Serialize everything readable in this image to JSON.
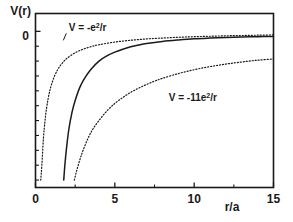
{
  "chart_data": {
    "type": "line",
    "title": "",
    "xlabel": "r/a",
    "ylabel": "V(r)",
    "xlim": [
      0,
      15
    ],
    "ylim": [
      -1.05,
      0.12
    ],
    "grid": false,
    "legend": "none",
    "x_ticks_major": [
      0,
      5,
      10,
      15
    ],
    "x_ticklabels": [
      "0",
      "5",
      "10",
      "15"
    ],
    "x_ticks_minor": [
      2.5,
      7.5,
      12.5
    ],
    "y_ticks_major": [
      0
    ],
    "y_ticklabels": [
      "0"
    ],
    "y_ticks_minor": [
      -0.1,
      -0.2,
      -0.3,
      -0.4,
      -0.5,
      -0.6,
      -0.7,
      -0.8,
      -0.9,
      -1.0
    ],
    "annotations": [
      {
        "id": "annotation-upper",
        "text": "V = -e",
        "sup": "2",
        "tail": "/r",
        "x": 2.1,
        "y": 0.0,
        "leader": true
      },
      {
        "id": "annotation-lower",
        "text": "V = -11e",
        "sup": "2",
        "tail": "/r",
        "x": 8.4,
        "y": -0.47,
        "leader": false
      }
    ],
    "series": [
      {
        "name": "V = -e^2/r",
        "style": "dotted",
        "color": "#1a1a1a",
        "formula": "-1/r",
        "x": [
          0.33,
          0.4,
          0.5,
          0.6,
          0.7,
          0.8,
          0.9,
          1.0,
          1.2,
          1.4,
          1.6,
          1.8,
          2.0,
          2.5,
          3.0,
          3.5,
          4.0,
          5.0,
          6.0,
          7.0,
          8.0,
          9.0,
          10.0,
          11.0,
          12.0,
          13.0,
          14.0,
          15.0
        ],
        "values": [
          -1.0,
          -0.9,
          -0.72,
          -0.6,
          -0.515,
          -0.45,
          -0.4,
          -0.36,
          -0.3,
          -0.257,
          -0.225,
          -0.2,
          -0.18,
          -0.144,
          -0.12,
          -0.103,
          -0.09,
          -0.072,
          -0.06,
          -0.051,
          -0.045,
          -0.04,
          -0.036,
          -0.033,
          -0.03,
          -0.028,
          -0.026,
          -0.024
        ]
      },
      {
        "name": "screened potential",
        "style": "solid",
        "color": "#1a1a1a",
        "x": [
          1.78,
          1.85,
          1.95,
          2.1,
          2.3,
          2.5,
          2.8,
          3.1,
          3.5,
          4.0,
          4.5,
          5.0,
          5.5,
          6.0,
          6.5,
          7.0,
          8.0,
          9.0,
          10.0,
          11.0,
          12.0,
          13.0,
          14.0,
          15.0
        ],
        "values": [
          -1.0,
          -0.9,
          -0.79,
          -0.66,
          -0.545,
          -0.465,
          -0.375,
          -0.315,
          -0.255,
          -0.2,
          -0.165,
          -0.14,
          -0.12,
          -0.104,
          -0.092,
          -0.082,
          -0.068,
          -0.058,
          -0.05,
          -0.045,
          -0.041,
          -0.038,
          -0.036,
          -0.034
        ]
      },
      {
        "name": "V = -11e^2/r",
        "style": "dotted",
        "color": "#1a1a1a",
        "formula": "-11/r",
        "x": [
          2.45,
          2.6,
          2.8,
          3.0,
          3.3,
          3.6,
          4.0,
          4.5,
          5.0,
          5.5,
          6.0,
          6.5,
          7.0,
          7.5,
          8.0,
          9.0,
          10.0,
          11.0,
          12.0,
          13.0,
          14.0,
          15.0
        ],
        "values": [
          -1.0,
          -0.935,
          -0.862,
          -0.8,
          -0.722,
          -0.66,
          -0.6,
          -0.535,
          -0.485,
          -0.445,
          -0.41,
          -0.382,
          -0.357,
          -0.335,
          -0.316,
          -0.284,
          -0.258,
          -0.237,
          -0.22,
          -0.206,
          -0.194,
          -0.186
        ]
      }
    ]
  },
  "axis": {
    "ylabel": "V(r)",
    "xlabel": "r/a",
    "zero_label": "0"
  },
  "colors": {
    "ink": "#1a1a1a",
    "background": "#ffffff"
  }
}
